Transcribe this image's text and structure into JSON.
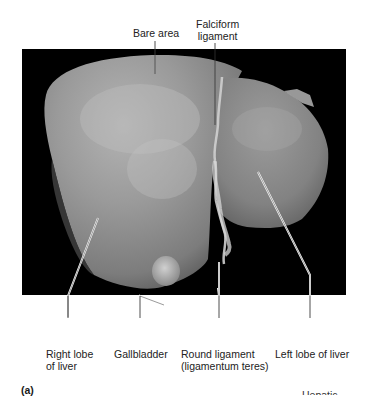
{
  "figure": {
    "panel_letter": "(a)",
    "cut_off_text": "Hepatic",
    "photo_description": "Anterior view of human liver specimen on black background",
    "colors": {
      "background": "#ffffff",
      "photo_background": "#000000",
      "liver_tone": "#8f8f8f",
      "leader_line": "#ffffff"
    }
  },
  "labels": {
    "top": [
      {
        "id": "bare-area",
        "lines": [
          "Bare area"
        ]
      },
      {
        "id": "falciform-ligament",
        "lines": [
          "Falciform",
          "ligament"
        ]
      }
    ],
    "bottom": [
      {
        "id": "right-lobe",
        "lines": [
          "Right lobe",
          "of liver"
        ]
      },
      {
        "id": "gallbladder",
        "lines": [
          "Gallbladder"
        ]
      },
      {
        "id": "round-ligament",
        "lines": [
          "Round ligament",
          "(ligamentum teres)"
        ]
      },
      {
        "id": "left-lobe",
        "lines": [
          "Left lobe of liver"
        ]
      }
    ]
  }
}
